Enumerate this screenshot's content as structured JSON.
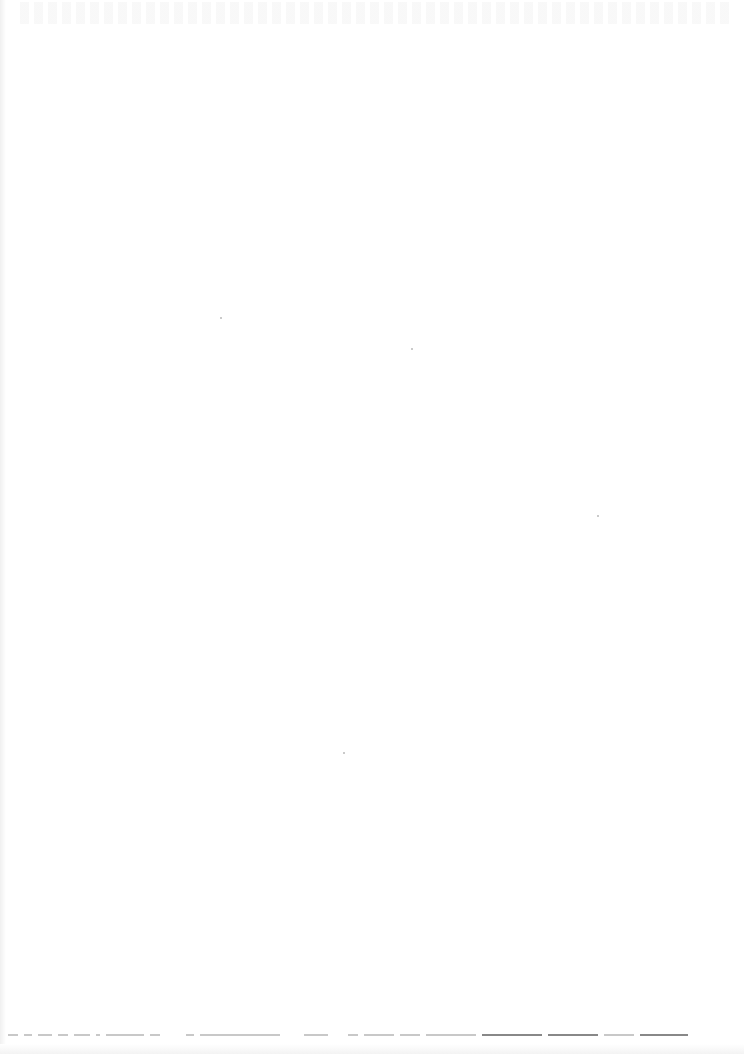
{
  "document": {
    "type": "scanned-page",
    "state": "mostly blank",
    "background_color": "#ffffff",
    "top_region": {
      "content": "faint bleed-through (illegible)"
    },
    "bottom_line": {
      "content": "illegible faint text line, partially cut off",
      "legible_text": ""
    },
    "specks": [
      {
        "x": 220,
        "y": 317
      },
      {
        "x": 411,
        "y": 348
      },
      {
        "x": 597,
        "y": 515
      },
      {
        "x": 343,
        "y": 752
      }
    ]
  }
}
